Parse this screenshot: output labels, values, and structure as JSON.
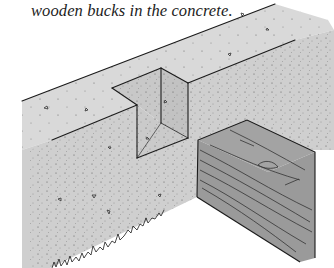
{
  "caption": {
    "text": "wooden bucks in the concrete."
  },
  "illustration": {
    "subject": "concrete wall with rectangular notch and wooden buck block",
    "colors": {
      "concrete_top": "#d9d9d9",
      "concrete_face": "#cdcdcd",
      "recess": "#c4c4c4",
      "wood": "#9c9c9c",
      "ink": "#1a1a1a",
      "background": "#ffffff"
    }
  }
}
